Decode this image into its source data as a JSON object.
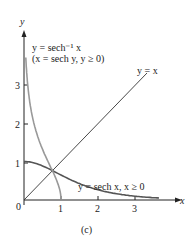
{
  "chart_data": {
    "type": "line",
    "title": "",
    "caption": "(c)",
    "xlabel": "x",
    "ylabel": "y",
    "xlim": [
      0,
      3.7
    ],
    "ylim": [
      0,
      3.7
    ],
    "x_ticks": [
      "1",
      "2",
      "3"
    ],
    "y_ticks": [
      "1",
      "2",
      "3"
    ],
    "origin_label": "0",
    "grid": false,
    "series": [
      {
        "name": "y = sech x, x ≥ 0",
        "color": "#555555",
        "function": "sech(x)"
      },
      {
        "name": "y = sech⁻¹ x (x = sech y, y ≥ 0)",
        "color": "#888888",
        "function": "arcsech(x)"
      },
      {
        "name": "y = x",
        "color": "#333333",
        "function": "x"
      }
    ],
    "annotations": [
      {
        "text": "y = sech⁻¹ x",
        "position": "upper-left"
      },
      {
        "text": "(x = sech y, y ≥ 0)",
        "position": "upper-left"
      },
      {
        "text": "y = x",
        "position": "upper-right"
      },
      {
        "text": "y = sech x, x ≥ 0",
        "position": "lower-right"
      }
    ]
  },
  "labels": {
    "y_axis": "y",
    "x_axis": "x",
    "origin": "0",
    "tick_x1": "1",
    "tick_x2": "2",
    "tick_x3": "3",
    "tick_y1": "1",
    "tick_y2": "2",
    "tick_y3": "3",
    "arcsech_line1": "y = sech⁻¹ x",
    "arcsech_line2": "(x = sech y, y ≥ 0)",
    "identity": "y = x",
    "sech": "y = sech x, x ≥ 0",
    "caption": "(c)"
  }
}
